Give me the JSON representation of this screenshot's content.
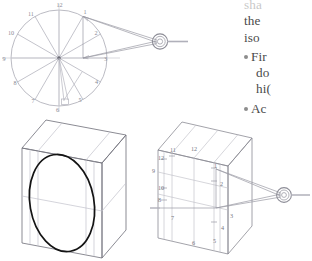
{
  "page": {
    "background": "#ffffff",
    "ink_dark": "#222222",
    "ink_line": "#8f8f98",
    "ink_faint": "#c4c4cc",
    "text_color": "#4a4a4a",
    "bullet_color": "#8d8d8d"
  },
  "figures": {
    "clock_plan": {
      "name": "clock-face-plan-diagram",
      "hour_labels": [
        "1",
        "2",
        "3",
        "4",
        "5",
        "6",
        "7",
        "8",
        "9",
        "10",
        "11",
        "12"
      ],
      "center_label": "",
      "viewpoint_icon": "eye-icon"
    },
    "box_ellipse": {
      "name": "isometric-box-with-ellipse",
      "labels": []
    },
    "box_clock": {
      "name": "isometric-box-with-clock-projection",
      "hour_labels": [
        "1",
        "2",
        "3",
        "4",
        "5",
        "6",
        "7",
        "8",
        "9",
        "10",
        "11",
        "12"
      ],
      "viewpoint_icon": "eye-icon"
    }
  },
  "text": {
    "clipped_line_top": "sha",
    "lines": [
      {
        "kind": "para",
        "text": "the"
      },
      {
        "kind": "para",
        "text": "iso"
      },
      {
        "kind": "bullet",
        "text": "Fir"
      },
      {
        "kind": "para",
        "text": "do"
      },
      {
        "kind": "para",
        "text": "hi("
      },
      {
        "kind": "bullet",
        "text": "Ac"
      }
    ]
  }
}
